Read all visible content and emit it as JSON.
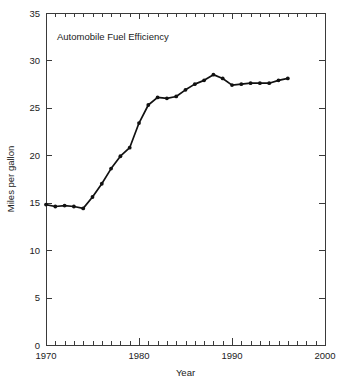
{
  "chart_data": {
    "type": "line",
    "title": "Automobile Fuel Efficiency",
    "xlabel": "Year",
    "ylabel": "Miles per gallon",
    "xlim": [
      1970,
      2000
    ],
    "ylim": [
      0,
      35
    ],
    "x_tick_labels": [
      "1970",
      "1980",
      "1990",
      "2000"
    ],
    "x_tick_values": [
      1970,
      1980,
      1990,
      2000
    ],
    "x_minor_tick_step": 1,
    "y_tick_labels": [
      "0",
      "5",
      "10",
      "15",
      "20",
      "25",
      "30",
      "35"
    ],
    "y_tick_values": [
      0,
      5,
      10,
      15,
      20,
      25,
      30,
      35
    ],
    "grid": false,
    "legend": "none",
    "marker": "filled-circle",
    "line_color": "#111111",
    "axis_color": "#3a3a3a",
    "background_color": "#ffffff",
    "series": [
      {
        "name": "Automobile Fuel Efficiency",
        "x": [
          1970,
          1971,
          1972,
          1973,
          1974,
          1975,
          1976,
          1977,
          1978,
          1979,
          1980,
          1981,
          1982,
          1983,
          1984,
          1985,
          1986,
          1987,
          1988,
          1989,
          1990,
          1991,
          1992,
          1993,
          1994,
          1995,
          1996
        ],
        "values": [
          14.8,
          14.6,
          14.7,
          14.6,
          14.4,
          15.6,
          17.0,
          18.6,
          19.9,
          20.8,
          23.4,
          25.3,
          26.1,
          26.0,
          26.2,
          26.9,
          27.5,
          27.9,
          28.5,
          28.1,
          27.4,
          27.5,
          27.6,
          27.6,
          27.6,
          27.9,
          28.1
        ]
      }
    ]
  },
  "plot_geometry": {
    "left": 46,
    "right": 325,
    "top": 13,
    "bottom": 345,
    "title_x": 57,
    "title_y": 40
  }
}
